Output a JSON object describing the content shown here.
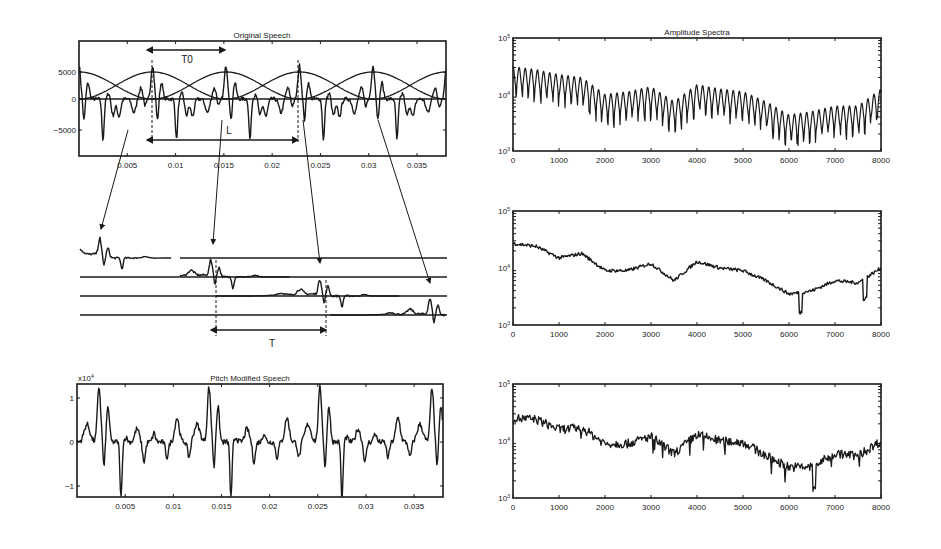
{
  "figure": {
    "panels": {
      "original": {
        "title": "Original Speech",
        "y_ticks": [
          "5000",
          "0",
          "-5000"
        ],
        "x_ticks": [
          "0.005",
          "0.01",
          "0.015",
          "0.02",
          "0.025",
          "0.03",
          "0.035"
        ],
        "annotations": {
          "period_label": "T0",
          "window_label": "L"
        }
      },
      "segments": {
        "annotations": {
          "period_label": "T"
        }
      },
      "modified": {
        "title": "Pitch Modified Speech",
        "y_scale_label": "x10",
        "y_scale_exp": "4",
        "y_ticks": [
          "1",
          "0",
          "-1"
        ],
        "x_ticks": [
          "0.005",
          "0.01",
          "0.015",
          "0.02",
          "0.025",
          "0.03",
          "0.035"
        ]
      },
      "spec1": {
        "title": "Amplitude Spectra",
        "y_ticks": [
          {
            "base": "10",
            "exp": "5"
          },
          {
            "base": "10",
            "exp": "4"
          },
          {
            "base": "10",
            "exp": "3"
          }
        ],
        "x_ticks": [
          "0",
          "1000",
          "2000",
          "3000",
          "4000",
          "5000",
          "6000",
          "7000",
          "8000"
        ]
      },
      "spec2": {
        "y_ticks": [
          {
            "base": "10",
            "exp": "5"
          },
          {
            "base": "10",
            "exp": "4"
          },
          {
            "base": "10",
            "exp": "3"
          }
        ],
        "x_ticks": [
          "0",
          "1000",
          "2000",
          "3000",
          "4000",
          "5000",
          "6000",
          "7000",
          "8000"
        ]
      },
      "spec3": {
        "y_ticks": [
          {
            "base": "10",
            "exp": "5"
          },
          {
            "base": "10",
            "exp": "4"
          },
          {
            "base": "10",
            "exp": "3"
          }
        ],
        "x_ticks": [
          "0",
          "1000",
          "2000",
          "3000",
          "4000",
          "5000",
          "6000",
          "7000",
          "8000"
        ]
      }
    }
  },
  "chart_data": [
    {
      "type": "line",
      "title": "Original Speech",
      "xlabel": "",
      "ylabel": "",
      "xlim": [
        0,
        0.038
      ],
      "ylim": [
        -8000,
        8000
      ],
      "x_ticks": [
        0.005,
        0.01,
        0.015,
        0.02,
        0.025,
        0.03,
        0.035
      ],
      "y_ticks": [
        -5000,
        0,
        5000
      ],
      "series": [
        {
          "name": "speech waveform",
          "description": "voiced speech, pitch period ~0.0075 s, peaks ~6000 near t=0.0075, 0.015, 0.0225, 0.03"
        },
        {
          "name": "overlapping analysis windows",
          "description": "raised-cosine windows of length L centered at pitch marks, peak amplitude ~5000"
        }
      ],
      "peaks_x": [
        0.0075,
        0.015,
        0.0225,
        0.03
      ],
      "annotations": [
        {
          "text": "T0",
          "from": 0.0075,
          "to": 0.015
        },
        {
          "text": "L",
          "from": 0.0075,
          "to": 0.0225
        }
      ],
      "grid": false
    },
    {
      "type": "line",
      "title": "",
      "description": "Four windowed speech segments stacked on offset baselines, re-spaced with new period T",
      "segments": 4,
      "annotations": [
        {
          "text": "T"
        }
      ],
      "grid": false
    },
    {
      "type": "line",
      "title": "Pitch Modified Speech",
      "xlim": [
        0,
        0.038
      ],
      "ylim": [
        -1.3,
        1.3
      ],
      "y_scale": "x10^4",
      "x_ticks": [
        0.005,
        0.01,
        0.015,
        0.02,
        0.025,
        0.03,
        0.035
      ],
      "y_ticks": [
        -1,
        0,
        1
      ],
      "peaks_x": [
        0.0025,
        0.0135,
        0.0248,
        0.036
      ],
      "peak_value": 1.25,
      "troughs_x": [
        0.0045,
        0.0157,
        0.0269
      ],
      "trough_value": -1.3,
      "grid": false
    },
    {
      "type": "line",
      "title": "Amplitude Spectra",
      "xlim": [
        0,
        8000
      ],
      "ylim": [
        1000,
        100000
      ],
      "yscale": "log",
      "x_ticks": [
        0,
        1000,
        2000,
        3000,
        4000,
        5000,
        6000,
        7000,
        8000
      ],
      "y_ticks": [
        "10^3",
        "10^4",
        "10^5"
      ],
      "x": [
        0,
        500,
        1000,
        1500,
        2000,
        2500,
        3000,
        3500,
        4000,
        4500,
        5000,
        5500,
        6000,
        6500,
        7000,
        7500,
        8000
      ],
      "values": [
        25000,
        22000,
        18000,
        16000,
        8000,
        9000,
        11000,
        6000,
        12000,
        10000,
        9000,
        6000,
        3500,
        4000,
        5000,
        5000,
        10000
      ],
      "description": "harmonic structure (comb) of original speech"
    },
    {
      "type": "line",
      "xlim": [
        0,
        8000
      ],
      "ylim": [
        1000,
        100000
      ],
      "yscale": "log",
      "x_ticks": [
        0,
        1000,
        2000,
        3000,
        4000,
        5000,
        6000,
        7000,
        8000
      ],
      "y_ticks": [
        "10^3",
        "10^4",
        "10^5"
      ],
      "x": [
        0,
        500,
        1000,
        1500,
        2000,
        2500,
        3000,
        3500,
        4000,
        4500,
        5000,
        5500,
        6000,
        6500,
        7000,
        7500,
        8000
      ],
      "values": [
        27000,
        24000,
        15000,
        18000,
        9000,
        9000,
        12000,
        6000,
        13000,
        10000,
        9000,
        6000,
        3500,
        4000,
        6000,
        5500,
        10000
      ],
      "description": "spectral envelope of a single windowed segment"
    },
    {
      "type": "line",
      "xlim": [
        0,
        8000
      ],
      "ylim": [
        1000,
        100000
      ],
      "yscale": "log",
      "x_ticks": [
        0,
        1000,
        2000,
        3000,
        4000,
        5000,
        6000,
        7000,
        8000
      ],
      "y_ticks": [
        "10^3",
        "10^4",
        "10^5"
      ],
      "x": [
        0,
        500,
        1000,
        1500,
        2000,
        2500,
        3000,
        3500,
        4000,
        4500,
        5000,
        5500,
        6000,
        6500,
        7000,
        7500,
        8000
      ],
      "values": [
        25000,
        24000,
        16000,
        17000,
        9000,
        9000,
        12000,
        6000,
        13000,
        10000,
        9500,
        5500,
        3500,
        3500,
        6000,
        5500,
        10000
      ],
      "description": "spectrum of pitch-modified speech"
    }
  ]
}
